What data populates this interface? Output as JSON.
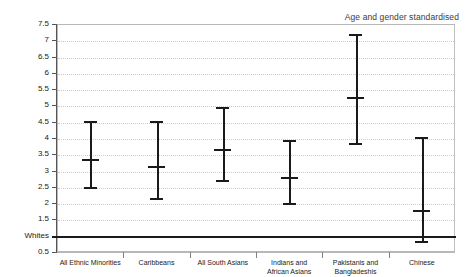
{
  "chart_data": {
    "type": "scatter",
    "title": "Age and gender standardised",
    "xlabel": "",
    "ylabel": "",
    "ylim": [
      0.5,
      7.5
    ],
    "grid": true,
    "legend": false,
    "reference_line": {
      "label": "Whites",
      "value": 1.0
    },
    "ytick_labels": [
      "7.5",
      "7",
      "6.5",
      "6",
      "5.5",
      "5",
      "4.5",
      "4",
      "3.5",
      "3",
      "2.5",
      "2",
      "1.5",
      "Whites",
      "0.5"
    ],
    "ytick_values": [
      7.5,
      7,
      6.5,
      6,
      5.5,
      5,
      4.5,
      4,
      3.5,
      3,
      2.5,
      2,
      1.5,
      1,
      0.5
    ],
    "categories": [
      "All Ethnic Minorities",
      "Caribbeans",
      "All South Asians",
      "Indians and\nAfrican Asians",
      "Pakistanis and\nBangladeshis",
      "Chinese"
    ],
    "series": [
      {
        "name": "Age and gender standardised ratio",
        "points": [
          {
            "category": "All Ethnic Minorities",
            "value": 3.36,
            "lower": 2.5,
            "upper": 4.53
          },
          {
            "category": "Caribbeans",
            "value": 3.14,
            "lower": 2.17,
            "upper": 4.52
          },
          {
            "category": "All South Asians",
            "value": 3.67,
            "lower": 2.72,
            "upper": 4.96
          },
          {
            "category": "Indians and African Asians",
            "value": 2.79,
            "lower": 2.0,
            "upper": 3.93
          },
          {
            "category": "Pakistanis and Bangladeshis",
            "value": 5.27,
            "lower": 3.85,
            "upper": 7.2
          },
          {
            "category": "Chinese",
            "value": 1.8,
            "lower": 0.85,
            "upper": 4.02
          }
        ]
      }
    ],
    "colors": {
      "marker": "#1a1a1a",
      "grid": "#cccccc",
      "frame": "#b8b8b8",
      "reference": "#1a1a1a"
    }
  }
}
